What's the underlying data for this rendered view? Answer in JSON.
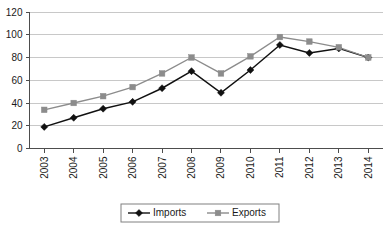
{
  "chart_data": {
    "type": "line",
    "title": "",
    "xlabel": "",
    "ylabel": "",
    "categories": [
      "2003",
      "2004",
      "2005",
      "2006",
      "2007",
      "2008",
      "2009",
      "2010",
      "2011",
      "2012",
      "2013",
      "2014"
    ],
    "series": [
      {
        "name": "Imports",
        "marker": "diamond",
        "color": "#111111",
        "values": [
          19,
          27,
          35,
          41,
          53,
          68,
          49,
          69,
          91,
          84,
          88,
          80
        ]
      },
      {
        "name": "Exports",
        "marker": "square",
        "color": "#8c8c8c",
        "values": [
          34,
          40,
          46,
          54,
          66,
          80,
          66,
          81,
          98,
          94,
          89,
          80
        ]
      }
    ],
    "ylim": [
      0,
      120
    ],
    "ytick_values": [
      0,
      20,
      40,
      60,
      80,
      100,
      120
    ],
    "ytick_labels": [
      "0",
      "20",
      "40",
      "60",
      "80",
      "100",
      "120"
    ],
    "grid": true,
    "grid_axis": "y",
    "xtick_rotation": 90,
    "legend": {
      "position": "bottom-center",
      "entries": [
        "Imports",
        "Exports"
      ]
    }
  },
  "colors": {
    "imports": "#111111",
    "exports": "#8c8c8c",
    "grid": "#c8c8c8",
    "axis": "#4d4d4d",
    "background": "#ffffff",
    "text": "#1a1a1a"
  }
}
